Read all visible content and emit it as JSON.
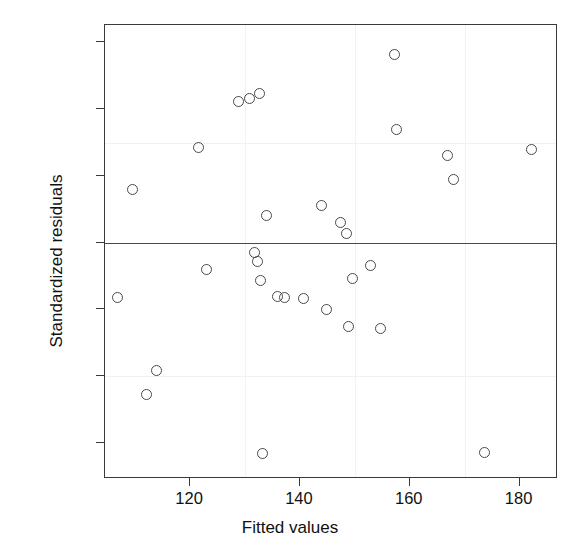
{
  "chart_data": {
    "type": "scatter",
    "title": "",
    "xlabel": "Fitted values",
    "ylabel": "Standardized residuals",
    "xlim": [
      104.5,
      187.0
    ],
    "ylim": [
      -1.77,
      1.63
    ],
    "xticks": [
      120,
      140,
      160,
      180
    ],
    "xtick_labels": [
      "120",
      "140",
      "160",
      "180"
    ],
    "yticks": [
      1.5,
      1.0,
      0.5,
      0.0,
      -0.5,
      -1.0,
      -1.5
    ],
    "ytick_labels": [
      "1.5",
      "1.0",
      "0.5",
      "0.0",
      "-0.5",
      "-1.0",
      "-1.5"
    ],
    "grid": "faint",
    "gridlines_y": [
      0.75,
      -1.0
    ],
    "gridlines_x": [
      130,
      150,
      170
    ],
    "reference_line_y": 0.0,
    "legend": "none",
    "marker": "open-circle",
    "marker_color": "#4a4a4a",
    "n_points": 30,
    "x": [
      106.8,
      109.5,
      112.0,
      113.8,
      121.6,
      123.0,
      128.9,
      130.9,
      131.8,
      132.5,
      132.6,
      132.8,
      133.2,
      134.0,
      135.8,
      136.9,
      137.9,
      140.7,
      143.9,
      145.0,
      147.5,
      148.3,
      149.8,
      151.0,
      152.8,
      154.8,
      157.2,
      157.4,
      166.8,
      173.6,
      182.2
    ],
    "y": [
      -0.41,
      0.4,
      -1.14,
      -0.96,
      0.71,
      -0.2,
      1.06,
      1.08,
      -0.07,
      -0.13,
      1.12,
      -0.28,
      -1.58,
      0.2,
      -0.4,
      -0.41,
      -0.41,
      -0.21,
      0.28,
      -0.5,
      0.15,
      -0.63,
      0.07,
      -0.27,
      -0.64,
      -0.17,
      1.41,
      -0.64,
      0.65,
      -1.57,
      0.7
    ],
    "points": [
      {
        "x": 106.8,
        "y": -0.41
      },
      {
        "x": 109.5,
        "y": 0.4
      },
      {
        "x": 112.0,
        "y": -1.14
      },
      {
        "x": 113.8,
        "y": -0.96
      },
      {
        "x": 121.6,
        "y": 0.71
      },
      {
        "x": 123.0,
        "y": -0.2
      },
      {
        "x": 128.9,
        "y": 1.06
      },
      {
        "x": 130.9,
        "y": 1.08
      },
      {
        "x": 131.8,
        "y": -0.07
      },
      {
        "x": 132.3,
        "y": -0.14
      },
      {
        "x": 132.6,
        "y": 1.12
      },
      {
        "x": 132.8,
        "y": -0.28
      },
      {
        "x": 133.2,
        "y": -1.58
      },
      {
        "x": 134.0,
        "y": 0.2
      },
      {
        "x": 136.0,
        "y": -0.4
      },
      {
        "x": 137.2,
        "y": -0.41
      },
      {
        "x": 140.7,
        "y": -0.42
      },
      {
        "x": 143.9,
        "y": 0.28
      },
      {
        "x": 144.8,
        "y": -0.5
      },
      {
        "x": 147.3,
        "y": 0.15
      },
      {
        "x": 148.5,
        "y": 0.07
      },
      {
        "x": 148.8,
        "y": -0.63
      },
      {
        "x": 149.6,
        "y": -0.27
      },
      {
        "x": 152.9,
        "y": -0.17
      },
      {
        "x": 154.6,
        "y": -0.64
      },
      {
        "x": 157.2,
        "y": 1.41
      },
      {
        "x": 157.6,
        "y": 0.85
      },
      {
        "x": 166.8,
        "y": 0.65
      },
      {
        "x": 168.0,
        "y": 0.47
      },
      {
        "x": 173.6,
        "y": -1.57
      },
      {
        "x": 182.2,
        "y": 0.7
      }
    ]
  }
}
